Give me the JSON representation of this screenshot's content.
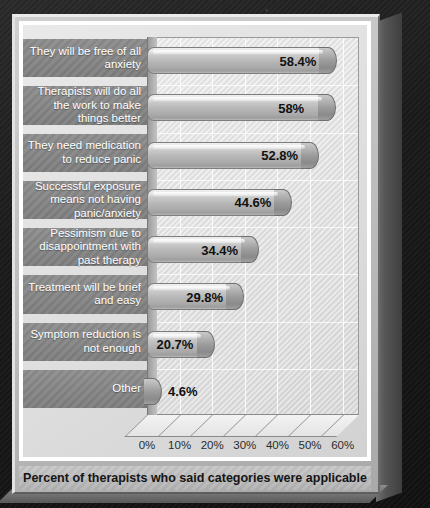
{
  "chart_data": {
    "type": "bar",
    "orientation": "horizontal",
    "title": "",
    "xlabel": "Percent of therapists who said categories were applicable",
    "ylabel": "",
    "xlim": [
      0,
      65
    ],
    "grid": true,
    "legend": "none",
    "categories": [
      "They will be free of all anxiety",
      "Therapists will do all the work to make things better",
      "They need medication to reduce panic",
      "Successful exposure means not having panic/anxiety",
      "Pessimism due to disappointment with past therapy",
      "Treatment will be brief and easy",
      "Symptom reduction is not enough",
      "Other"
    ],
    "values": [
      58.4,
      58,
      52.8,
      44.6,
      34.4,
      29.8,
      20.7,
      4.6
    ],
    "value_labels": [
      "58.4%",
      "58%",
      "52.8%",
      "44.6%",
      "34.4%",
      "29.8%",
      "20.7%",
      "4.6%"
    ],
    "x_ticks": [
      0,
      10,
      20,
      30,
      40,
      50,
      60
    ],
    "x_tick_labels": [
      "0%",
      "10%",
      "20%",
      "30%",
      "40%",
      "50%",
      "60%"
    ]
  },
  "caption": {
    "text": "Percent of therapists who said categories were applicable"
  },
  "colors": {
    "panel": "#bdbdbd",
    "category_band": "#838383",
    "bar_face": "#b6b6b6",
    "plot_background": "#e4e4e4",
    "label_text": "#ffffff",
    "value_text": "#111111",
    "backdrop": "#1c1c1c"
  }
}
